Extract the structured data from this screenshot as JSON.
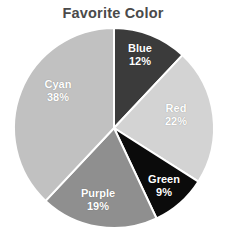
{
  "chart_data": {
    "type": "pie",
    "title": "Favorite Color",
    "xlabel": "",
    "ylabel": "",
    "categories": [
      "Blue",
      "Red",
      "Green",
      "Purple",
      "Cyan"
    ],
    "values": [
      12,
      22,
      9,
      19,
      38
    ],
    "value_unit": "%",
    "legend": "none",
    "grid": false,
    "start_angle_deg": 0,
    "direction": "clockwise",
    "slices": [
      {
        "label": "Blue",
        "value": 12,
        "percent_text": "12%",
        "color": "#3b3b3b",
        "label_color": "#ffffff",
        "label_x": 140,
        "label_y": 54
      },
      {
        "label": "Red",
        "value": 22,
        "percent_text": "22%",
        "color": "#d3d3d3",
        "label_color": "#ffffff",
        "label_x": 176,
        "label_y": 114
      },
      {
        "label": "Green",
        "value": 9,
        "percent_text": "9%",
        "color": "#0b0b0b",
        "label_color": "#ffffff",
        "label_x": 164,
        "label_y": 185
      },
      {
        "label": "Purple",
        "value": 19,
        "percent_text": "19%",
        "color": "#8f8f8f",
        "label_color": "#ffffff",
        "label_x": 98,
        "label_y": 199
      },
      {
        "label": "Cyan",
        "value": 38,
        "percent_text": "38%",
        "color": "#c1c1c1",
        "label_color": "#ffffff",
        "label_x": 58,
        "label_y": 90
      }
    ],
    "geometry": {
      "center_x": 114,
      "center_y": 128,
      "radius": 100
    },
    "background": "#ffffff",
    "title_color": "#4a4a4a",
    "separator_color": "#ffffff"
  }
}
